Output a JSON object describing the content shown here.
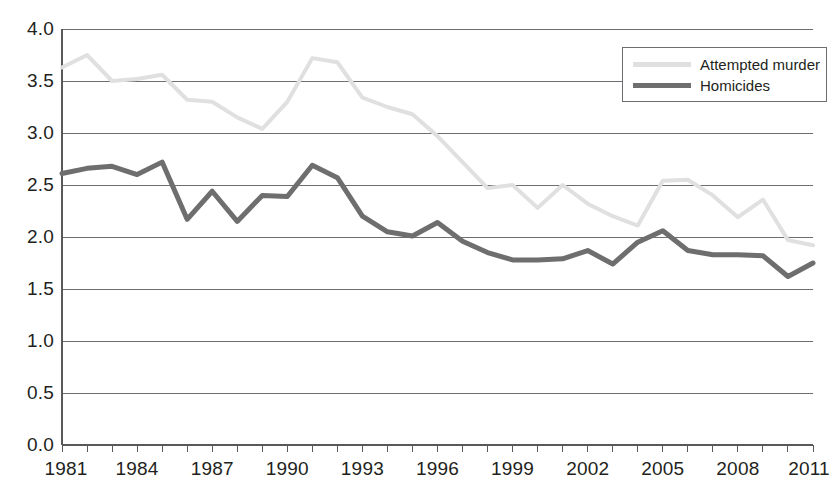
{
  "chart_data": {
    "type": "line",
    "title": "",
    "subtitle": "",
    "xlabel": "",
    "ylabel": "",
    "x": [
      1981,
      1982,
      1983,
      1984,
      1985,
      1986,
      1987,
      1988,
      1989,
      1990,
      1991,
      1992,
      1993,
      1994,
      1995,
      1996,
      1997,
      1998,
      1999,
      2000,
      2001,
      2002,
      2003,
      2004,
      2005,
      2006,
      2007,
      2008,
      2009,
      2010,
      2011
    ],
    "xlim": [
      1981,
      2011
    ],
    "ylim": [
      0.0,
      4.0
    ],
    "ytick_labels": [
      "0.0",
      "0.5",
      "1.0",
      "1.5",
      "2.0",
      "2.5",
      "3.0",
      "3.5",
      "4.0"
    ],
    "ytick_values": [
      0.0,
      0.5,
      1.0,
      1.5,
      2.0,
      2.5,
      3.0,
      3.5,
      4.0
    ],
    "xtick_labels": [
      "1981",
      "1984",
      "1987",
      "1990",
      "1993",
      "1996",
      "1999",
      "2002",
      "2005",
      "2008",
      "2011"
    ],
    "xtick_values": [
      1981,
      1984,
      1987,
      1990,
      1993,
      1996,
      1999,
      2002,
      2005,
      2008,
      2011
    ],
    "grid": "horizontal",
    "legend_position": "top-right",
    "series": [
      {
        "name": "Attempted murder",
        "color": "#e0e0e0",
        "width": 4,
        "values": [
          3.63,
          3.75,
          3.5,
          3.52,
          3.56,
          3.32,
          3.3,
          3.15,
          3.04,
          3.3,
          3.72,
          3.68,
          3.34,
          3.25,
          3.18,
          2.97,
          2.72,
          2.47,
          2.5,
          2.28,
          2.5,
          2.32,
          2.2,
          2.11,
          2.54,
          2.55,
          2.4,
          2.19,
          2.36,
          1.97,
          1.92
        ]
      },
      {
        "name": "Homicides",
        "color": "#6e6e6e",
        "width": 5,
        "values": [
          2.61,
          2.66,
          2.68,
          2.6,
          2.72,
          2.17,
          2.44,
          2.15,
          2.4,
          2.39,
          2.69,
          2.57,
          2.2,
          2.05,
          2.01,
          2.14,
          1.96,
          1.85,
          1.78,
          1.78,
          1.79,
          1.87,
          1.74,
          1.95,
          2.06,
          1.87,
          1.83,
          1.83,
          1.82,
          1.62,
          1.75
        ]
      }
    ]
  },
  "legend": {
    "items": [
      {
        "label": "Attempted murder",
        "color": "#e0e0e0"
      },
      {
        "label": "Homicides",
        "color": "#6e6e6e"
      }
    ]
  },
  "axes": {
    "axis_color": "#58595b",
    "grid_color": "#6d6e71"
  }
}
